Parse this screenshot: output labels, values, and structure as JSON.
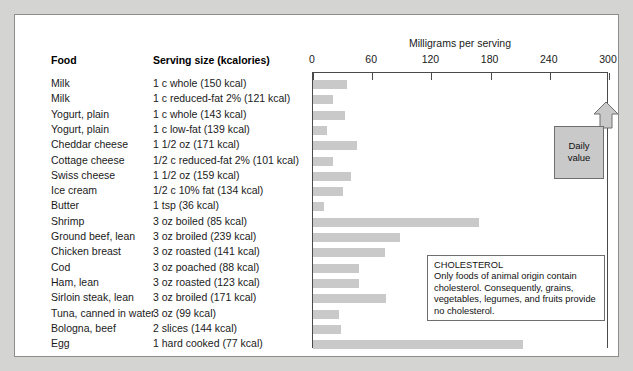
{
  "figure": {
    "axis_title": "Milligrams per serving",
    "columns": {
      "food": "Food",
      "serving": "Serving size (kcalories)"
    }
  },
  "daily_value_callout": {
    "line1": "Daily",
    "line2": "value",
    "at_value": 300
  },
  "note": {
    "title": "CHOLESTEROL",
    "body": "Only foods of animal origin contain cholesterol. Consequently, grains, vegetables, legumes, and fruits provide no cholesterol."
  },
  "colors": {
    "page_background": "#d4d4d2",
    "panel_background": "#ffffff",
    "panel_border": "#8d8d8d",
    "bar_fill": "#c9c9c9",
    "axis": "#4a4a4a",
    "callout_fill": "#c9c9c9",
    "callout_border": "#6e6e6e",
    "text": "#1a1a1a"
  },
  "chart_data": {
    "type": "bar",
    "title": "",
    "xlabel": "Milligrams per serving",
    "ylabel": "",
    "xlim": [
      0,
      300
    ],
    "ticks": [
      0,
      60,
      120,
      180,
      240,
      300
    ],
    "grid": false,
    "orientation": "horizontal",
    "legend": "none",
    "annotations": [
      "Daily value",
      "CHOLESTEROL Only foods of animal origin contain cholesterol. Consequently, grains, vegetables, legumes, and fruits provide no cholesterol."
    ],
    "categories": [
      "Milk",
      "Milk",
      "Yogurt, plain",
      "Yogurt, plain",
      "Cheddar cheese",
      "Cottage cheese",
      "Swiss cheese",
      "Ice cream",
      "Butter",
      "Shrimp",
      "Ground beef, lean",
      "Chicken breast",
      "Cod",
      "Ham, lean",
      "Sirloin steak, lean",
      "Tuna, canned in water",
      "Bologna, beef",
      "Egg"
    ],
    "servings": [
      "1 c whole (150 kcal)",
      "1 c reduced-fat 2% (121 kcal)",
      "1 c whole (143 kcal)",
      "1 c low-fat  (139 kcal)",
      "1 1/2 oz (171 kcal)",
      "1/2 c reduced-fat 2% (101 kcal)",
      "1 1/2 oz (159 kcal)",
      "1/2 c 10% fat (134 kcal)",
      "1 tsp (36 kcal)",
      "3 oz boiled (85 kcal)",
      "3 oz broiled (239 kcal)",
      "3 oz roasted (141 kcal)",
      "3 oz poached (88 kcal)",
      "3 oz roasted (123 kcal)",
      "3 oz broiled (171 kcal)",
      "3 oz (99 kcal)",
      "2 slices (144 kcal)",
      "1 hard cooked (77 kcal)"
    ],
    "values": [
      34,
      20,
      32,
      14,
      45,
      20,
      39,
      30,
      11,
      168,
      88,
      73,
      47,
      47,
      74,
      26,
      28,
      213
    ],
    "units": "mg"
  }
}
